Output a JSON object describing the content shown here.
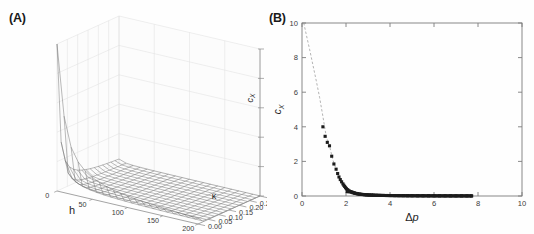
{
  "figure": {
    "background_color": "#fefefe",
    "panels": [
      {
        "id": "A",
        "label": "(A)"
      },
      {
        "id": "B",
        "label": "(B)"
      }
    ]
  },
  "chart_data": [
    {
      "type": "line",
      "panel": "A",
      "title": "",
      "subtitle": "",
      "projection": "3d-surface-wireframe",
      "xlabel": "h",
      "ylabel": "κ",
      "zlabel": "ĉ_X",
      "zlabel_display": "c",
      "zlabel_sub": "X",
      "xlim": [
        0,
        200
      ],
      "ylim": [
        0.0,
        0.3
      ],
      "zlim": [
        0,
        1000
      ],
      "xticks": [
        "0",
        "50",
        "100",
        "150",
        "200"
      ],
      "xtick_values": [
        0,
        50,
        100,
        150,
        200
      ],
      "yticks": [
        "0.00",
        "0.05",
        "0.10",
        "0.15",
        "0.20",
        "0.25",
        "0.30"
      ],
      "ytick_values": [
        0.0,
        0.05,
        0.1,
        0.15,
        0.2,
        0.25,
        0.3
      ],
      "zticks": [
        "0",
        "200",
        "400",
        "600",
        "800",
        "1000"
      ],
      "ztick_values": [
        0,
        200,
        400,
        600,
        800,
        1000
      ],
      "grid": true,
      "legend": "none",
      "surface_description": "Monotonically decaying surface; sharp singular peak reaching ~1000 at the corner where h is small and kappa is small, decaying rapidly toward near-zero over most of the (h, kappa) domain.",
      "mesh_color": "#6e6e6e",
      "grid_color": "#d8d8d8",
      "peak_value": 1000,
      "surface_grid": {
        "n_h": 21,
        "n_kappa": 16
      }
    },
    {
      "type": "scatter",
      "panel": "B",
      "title": "",
      "xlabel": "Δp",
      "ylabel": "ĉ_X",
      "ylabel_display": "c",
      "ylabel_sub": "X",
      "xlim": [
        0,
        10
      ],
      "ylim": [
        0,
        10
      ],
      "xticks": [
        "0",
        "2",
        "4",
        "6",
        "8",
        "10"
      ],
      "xtick_values": [
        0,
        2,
        4,
        6,
        8,
        10
      ],
      "yticks": [
        "0",
        "2",
        "4",
        "6",
        "8",
        "10"
      ],
      "ytick_values": [
        0,
        2,
        4,
        6,
        8,
        10
      ],
      "grid": false,
      "legend": "none",
      "marker_color": "#1c1c1c",
      "line_style": "dashed",
      "line_color": "#9a9a9a",
      "series": [
        {
          "name": "c_X vs Δp",
          "x": [
            0.95,
            1.05,
            1.15,
            1.25,
            1.35,
            1.45,
            1.55,
            1.62,
            1.68,
            1.74,
            1.8,
            1.86,
            1.9,
            1.94,
            1.98,
            2.02,
            2.06,
            2.1,
            2.15,
            2.2,
            2.26,
            2.32,
            2.38,
            2.45,
            2.52,
            2.6,
            2.68,
            2.76,
            2.85,
            2.95,
            3.05,
            3.15,
            3.25,
            3.4,
            3.55,
            3.7,
            3.85,
            4.0,
            4.2,
            4.4,
            4.6,
            4.8,
            5.0,
            5.25,
            5.5,
            5.75,
            6.0,
            6.25,
            6.5,
            6.75,
            7.0,
            7.25,
            7.5,
            7.7
          ],
          "y": [
            4.0,
            3.45,
            3.1,
            2.9,
            2.3,
            1.85,
            1.55,
            1.3,
            1.1,
            0.95,
            0.82,
            0.7,
            0.62,
            0.55,
            0.48,
            0.42,
            0.37,
            0.33,
            0.29,
            0.25,
            0.22,
            0.19,
            0.17,
            0.15,
            0.13,
            0.11,
            0.1,
            0.09,
            0.08,
            0.07,
            0.06,
            0.055,
            0.05,
            0.045,
            0.04,
            0.035,
            0.03,
            0.028,
            0.025,
            0.022,
            0.02,
            0.018,
            0.016,
            0.014,
            0.013,
            0.012,
            0.011,
            0.01,
            0.009,
            0.008,
            0.007,
            0.006,
            0.005,
            0.004
          ]
        }
      ],
      "dashed_guide": {
        "description": "Dashed gray curve passing through the markers and extrapolating up to c_X = 10 near Δp ≈ 0.1",
        "x": [
          0.08,
          0.2,
          0.35,
          0.5,
          0.65,
          0.8,
          0.95,
          1.1,
          1.25,
          1.4,
          1.55,
          1.7,
          1.85,
          2.0,
          2.2,
          2.5,
          3.0,
          4.0,
          6.0,
          7.7
        ],
        "y": [
          10.0,
          9.3,
          8.45,
          7.55,
          6.65,
          5.7,
          4.6,
          3.45,
          2.9,
          2.1,
          1.55,
          1.05,
          0.72,
          0.45,
          0.25,
          0.14,
          0.07,
          0.028,
          0.011,
          0.004
        ]
      }
    }
  ]
}
